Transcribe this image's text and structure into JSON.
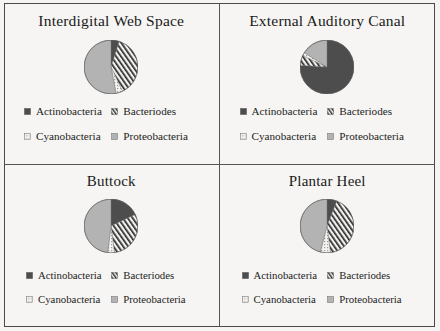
{
  "figure": {
    "type": "pie-panel-grid",
    "background_color": "#f5f4f2",
    "frame_color": "#4a4a4a"
  },
  "legend_series": [
    {
      "name": "Actinobacteria",
      "key": "actinobacteria",
      "fill": "solid-dark",
      "color": "#4d4d4d"
    },
    {
      "name": "Bacteriodes",
      "key": "bacteriodes",
      "fill": "diagonal-hatch",
      "color": "#2f2f2f"
    },
    {
      "name": "Cyanobacteria",
      "key": "cyanobacteria",
      "fill": "dotted",
      "color": "#bdbdbd"
    },
    {
      "name": "Proteobacteria",
      "key": "proteobacteria",
      "fill": "solid-light",
      "color": "#b3b3b3"
    }
  ],
  "panels": [
    {
      "id": "interdigital-web-space",
      "title": "Interdigital Web Space",
      "position": "top-left",
      "chart_data": {
        "type": "pie",
        "title": "Interdigital Web Space",
        "categories": [
          "Actinobacteria",
          "Bacteriodes",
          "Cyanobacteria",
          "Proteobacteria"
        ],
        "values": [
          5,
          38,
          4,
          53
        ],
        "unit": "percent",
        "start_angle_deg": 0,
        "direction": "clockwise",
        "legend_position": "bottom"
      }
    },
    {
      "id": "external-auditory-canal",
      "title": "External Auditory Canal",
      "position": "top-right",
      "chart_data": {
        "type": "pie",
        "title": "External Auditory Canal",
        "categories": [
          "Actinobacteria",
          "Bacteriodes",
          "Cyanobacteria",
          "Proteobacteria"
        ],
        "values": [
          76,
          6,
          2,
          16
        ],
        "unit": "percent",
        "start_angle_deg": 0,
        "direction": "clockwise",
        "legend_position": "bottom"
      }
    },
    {
      "id": "buttock",
      "title": "Buttock",
      "position": "bottom-left",
      "chart_data": {
        "type": "pie",
        "title": "Buttock",
        "categories": [
          "Actinobacteria",
          "Bacteriodes",
          "Cyanobacteria",
          "Proteobacteria"
        ],
        "values": [
          18,
          30,
          4,
          48
        ],
        "unit": "percent",
        "start_angle_deg": 0,
        "direction": "clockwise",
        "legend_position": "bottom"
      }
    },
    {
      "id": "plantar-heel",
      "title": "Plantar Heel",
      "position": "bottom-right",
      "chart_data": {
        "type": "pie",
        "title": "Plantar Heel",
        "categories": [
          "Actinobacteria",
          "Bacteriodes",
          "Cyanobacteria",
          "Proteobacteria"
        ],
        "values": [
          6,
          42,
          6,
          46
        ],
        "unit": "percent",
        "start_angle_deg": 0,
        "direction": "clockwise",
        "legend_position": "bottom"
      }
    }
  ]
}
